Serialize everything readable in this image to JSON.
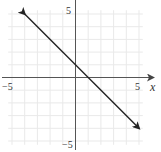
{
  "chart_data": {
    "type": "line",
    "title": "",
    "xlabel": "x",
    "ylabel": "",
    "xlim": [
      -5,
      5
    ],
    "ylim": [
      -5,
      5
    ],
    "grid": true,
    "x_ticks_labeled": [
      "-5",
      "5"
    ],
    "y_ticks_labeled": [
      "5",
      "-5"
    ],
    "series": [
      {
        "name": "y = -x + 1",
        "x": [
          -4,
          5
        ],
        "y": [
          5,
          -4
        ],
        "arrows_both_ends": true
      }
    ]
  },
  "labels": {
    "x_axis": "x",
    "x_min": "−5",
    "x_max": "5",
    "y_max": "5",
    "y_min": "−5"
  },
  "colors": {
    "grid": "#e8e8e8",
    "axis": "#555555",
    "line": "#222222"
  }
}
